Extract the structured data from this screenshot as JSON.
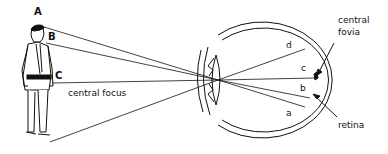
{
  "diagram": {
    "labels": {
      "point_a": "A",
      "point_b": "B",
      "point_c": "C",
      "central_focus": "central focus",
      "retina_d": "d",
      "retina_c": "c",
      "retina_b": "b",
      "retina_a": "a",
      "central_fovia_line1": "central",
      "central_fovia_line2": "fovia",
      "retina": "retina"
    },
    "colors": {
      "ink": "#111111",
      "background": "#ffffff"
    }
  }
}
